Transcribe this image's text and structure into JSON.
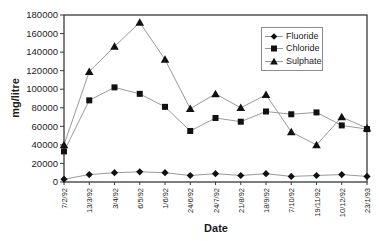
{
  "chart_data": {
    "type": "line",
    "title": "",
    "xlabel": "Date",
    "ylabel": "mg/litre",
    "ylim": [
      0,
      180000
    ],
    "ytick_step": 20000,
    "grid": false,
    "legend_position": "top-right-inside",
    "categories": [
      "7/2/92",
      "13/3/92",
      "3/4/92",
      "6/5/92",
      "1/6/92",
      "24/6/92",
      "24/7/92",
      "21/8/92",
      "18/9/92",
      "7/10/92",
      "19/11/92",
      "10/12/92",
      "23/1/93"
    ],
    "series": [
      {
        "name": "Fluoride",
        "marker": "diamond",
        "values": [
          3000,
          8000,
          10000,
          11000,
          10000,
          7000,
          9000,
          7000,
          9000,
          6000,
          7000,
          8000,
          6000
        ]
      },
      {
        "name": "Chloride",
        "marker": "square",
        "values": [
          33000,
          88000,
          102000,
          95000,
          81000,
          55000,
          69000,
          65000,
          76000,
          73000,
          75000,
          61000,
          57000
        ]
      },
      {
        "name": "Sulphate",
        "marker": "triangle",
        "values": [
          40000,
          119000,
          146000,
          172000,
          132000,
          79000,
          95000,
          80000,
          94000,
          54000,
          40000,
          70000,
          58000
        ]
      }
    ]
  },
  "colors": {
    "background": "#ffffff",
    "text": "#1c1c1c",
    "axis": "#3a3a3a",
    "series_line": "#9a9a9a",
    "marker": "#111111",
    "legend_border": "#8c8c8c"
  }
}
